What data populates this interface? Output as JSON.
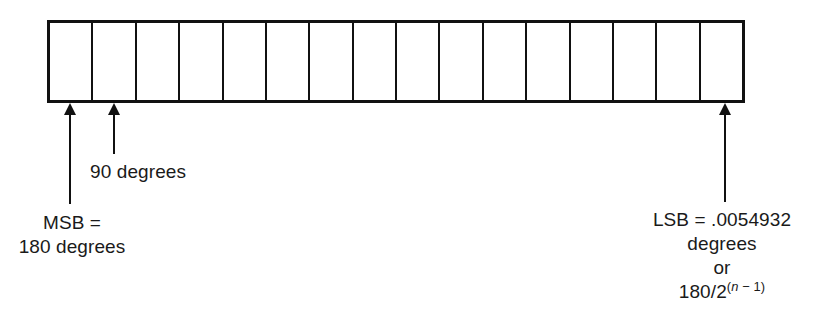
{
  "diagram": {
    "bitfield": {
      "cell_count": 16,
      "cells": [
        {
          "index": 1
        },
        {
          "index": 2
        },
        {
          "index": 3
        },
        {
          "index": 4
        },
        {
          "index": 5
        },
        {
          "index": 6
        },
        {
          "index": 7
        },
        {
          "index": 8
        },
        {
          "index": 9
        },
        {
          "index": 10
        },
        {
          "index": 11
        },
        {
          "index": 12
        },
        {
          "index": 13
        },
        {
          "index": 14
        },
        {
          "index": 15
        },
        {
          "index": 16
        }
      ],
      "border_color": "#111111",
      "fill_color": "#ffffff"
    },
    "annotations": {
      "msb": {
        "line1": "MSB =",
        "line2": "180 degrees",
        "pointer_icon": "up-arrow-icon"
      },
      "ninety": {
        "text": "90 degrees",
        "pointer_icon": "up-arrow-icon"
      },
      "lsb": {
        "line1": "LSB = .0054932",
        "line2": "degrees",
        "line3": "or",
        "line4_base": "180/2",
        "line4_exponent_open": "(",
        "line4_exponent_var": "n",
        "line4_exponent_rest": " − 1)",
        "pointer_icon": "up-arrow-icon"
      }
    }
  }
}
